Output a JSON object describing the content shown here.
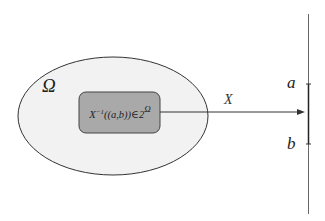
{
  "diagram": {
    "sample_space_label": "Ω",
    "preimage_label": "X⁻¹((a, b)) ∈ 2",
    "preimage_label_parts": {
      "base": "X",
      "sup": "−1",
      "arg": "((a,b))∈2",
      "power": "Ω"
    },
    "mapping_label": "X",
    "axis_ticks": [
      {
        "label": "a"
      },
      {
        "label": "b"
      }
    ],
    "colors": {
      "ellipse_fill": "#f2f2f2",
      "ellipse_stroke": "#333333",
      "rect_fill": "#a9a9a9",
      "rect_stroke": "#444444",
      "line": "#333333"
    }
  }
}
